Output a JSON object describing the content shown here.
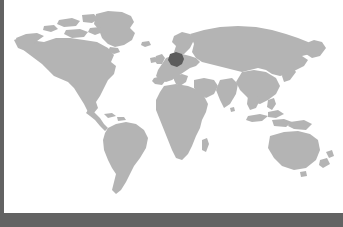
{
  "map": {
    "title": "World Map",
    "projection": "equirectangular",
    "background_color": "#ffffff",
    "land_color": "#b4b4b4",
    "highlight_color": "#5c5c5c",
    "border_color": "#636363",
    "highlighted_region": {
      "name": "Germany",
      "label": "Germany",
      "color": "#5c5c5c"
    },
    "regions": [
      {
        "name": "North America",
        "color": "#b4b4b4"
      },
      {
        "name": "Greenland",
        "color": "#b4b4b4"
      },
      {
        "name": "South America",
        "color": "#b4b4b4"
      },
      {
        "name": "Europe",
        "color": "#b4b4b4"
      },
      {
        "name": "Africa",
        "color": "#b4b4b4"
      },
      {
        "name": "Asia",
        "color": "#b4b4b4"
      },
      {
        "name": "Australia",
        "color": "#b4b4b4"
      },
      {
        "name": "New Zealand",
        "color": "#b4b4b4"
      },
      {
        "name": "Indonesia",
        "color": "#b4b4b4"
      },
      {
        "name": "Japan",
        "color": "#b4b4b4"
      },
      {
        "name": "British Isles",
        "color": "#b4b4b4"
      },
      {
        "name": "Madagascar",
        "color": "#b4b4b4"
      },
      {
        "name": "Iceland",
        "color": "#b4b4b4"
      }
    ]
  },
  "chrome": {
    "left_rail_label": "",
    "bottom_rail_label": ""
  }
}
